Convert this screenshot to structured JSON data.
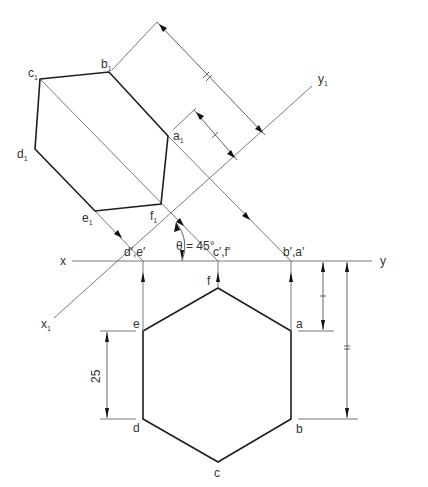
{
  "figure": {
    "type": "auxiliary-projection-drawing",
    "angle_label": "θ = 45°",
    "reference_lines": {
      "xy": {
        "left_label": "x",
        "right_label": "y"
      },
      "x1y1": {
        "left_label": "x",
        "left_sub": "1",
        "right_label": "y",
        "right_sub": "1"
      }
    },
    "elevation_labels": {
      "de": "d′,e′",
      "cf": "c′,f′",
      "ba": "b′,a′"
    },
    "plan_vertices": [
      {
        "name": "a",
        "label": "a"
      },
      {
        "name": "b",
        "label": "b"
      },
      {
        "name": "c",
        "label": "c"
      },
      {
        "name": "d",
        "label": "d"
      },
      {
        "name": "e",
        "label": "e"
      },
      {
        "name": "f",
        "label": "f"
      }
    ],
    "auxiliary_vertices": [
      {
        "name": "a1",
        "label": "a",
        "sub": "1"
      },
      {
        "name": "b1",
        "label": "b",
        "sub": "1"
      },
      {
        "name": "c1",
        "label": "c",
        "sub": "1"
      },
      {
        "name": "d1",
        "label": "d",
        "sub": "1"
      },
      {
        "name": "e1",
        "label": "e",
        "sub": "1"
      },
      {
        "name": "f1",
        "label": "f",
        "sub": "1"
      }
    ],
    "dimensions": {
      "side_length": "25",
      "tick_single": "|",
      "tick_double": "||"
    },
    "colors": {
      "outline": "#1e1e1e",
      "construction": "#6a6a6a",
      "text": "#333333"
    }
  }
}
